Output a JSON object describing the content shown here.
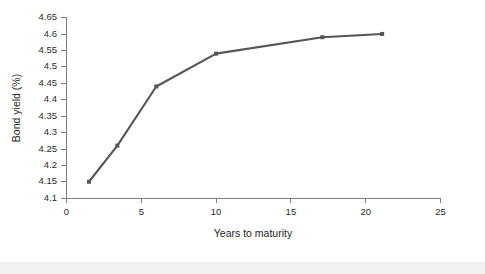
{
  "figure": {
    "background_color": "#ffffff",
    "footer_band_color": "#f1f1f2"
  },
  "chart_data": {
    "type": "line",
    "title": "",
    "subtitle": "",
    "xlabel": "Years to maturity",
    "ylabel": "Bond yield (%)",
    "xlim": [
      0,
      25
    ],
    "ylim": [
      4.1,
      4.65
    ],
    "xticks": [
      0,
      5,
      10,
      15,
      20,
      25
    ],
    "xtick_labels": [
      "0",
      "5",
      "10",
      "15",
      "20",
      "25"
    ],
    "yticks": [
      4.1,
      4.15,
      4.2,
      4.25,
      4.3,
      4.35,
      4.4,
      4.45,
      4.5,
      4.55,
      4.6,
      4.65
    ],
    "ytick_labels": [
      "4.1",
      "4.15",
      "4.2",
      "4.25",
      "4.3",
      "4.35",
      "4.4",
      "4.45",
      "4.5",
      "4.55",
      "4.6",
      "4.65"
    ],
    "grid": false,
    "legend": null,
    "legend_position": "none",
    "series": [
      {
        "name": "Bond yield curve",
        "color": "#565656",
        "marker": "square",
        "marker_size": 4,
        "line_width": 2.1,
        "x": [
          1.5,
          3.4,
          6.0,
          10.0,
          17.1,
          21.1
        ],
        "y": [
          4.15,
          4.26,
          4.44,
          4.54,
          4.59,
          4.6
        ]
      }
    ],
    "annotations": []
  },
  "axes": {
    "x_axis_color": "#7d7d7d",
    "y_axis_color": "#7d7d7d",
    "tick_label_color": "#2b2b2b",
    "axis_title_color": "#1f1f1f"
  }
}
